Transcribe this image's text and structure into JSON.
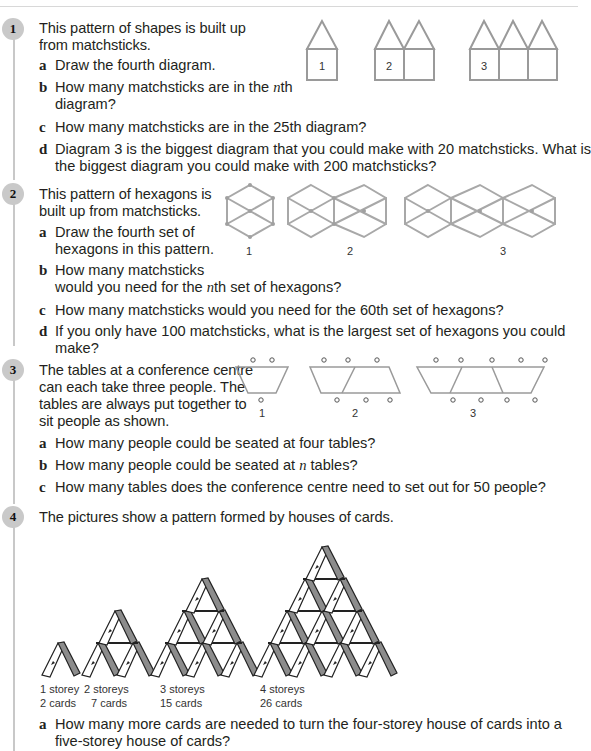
{
  "questions": [
    {
      "number": "1",
      "intro": [
        "This pattern of shapes is built up",
        "from matchsticks."
      ],
      "parts": [
        {
          "label": "a",
          "lines": [
            "Draw the fourth diagram."
          ]
        },
        {
          "label": "b",
          "lines_pre": "How many matchsticks are in the ",
          "var": "n",
          "lines_post": "th",
          "line2": "diagram?"
        },
        {
          "label": "c",
          "lines": [
            "How many matchsticks are in the 25th diagram?"
          ]
        },
        {
          "label": "d",
          "lines": [
            "Diagram 3 is the biggest diagram that you could make with 20 matchsticks. What is",
            "the biggest diagram you could make with 200 matchsticks?"
          ]
        }
      ],
      "figure_labels": [
        "1",
        "2",
        "3"
      ]
    },
    {
      "number": "2",
      "intro": [
        "This pattern of hexagons is",
        "built up from matchsticks."
      ],
      "parts": [
        {
          "label": "a",
          "lines": [
            "Draw the fourth set of",
            "hexagons in this pattern."
          ]
        },
        {
          "label": "b",
          "line1": "How many matchsticks",
          "pre": "would you need for the ",
          "var": "n",
          "post": "th set of hexagons?"
        },
        {
          "label": "c",
          "lines": [
            "How many matchsticks would you need for the 60th set of hexagons?"
          ]
        },
        {
          "label": "d",
          "lines": [
            "If you only have 100 matchsticks, what is the largest set of hexagons you could",
            "make?"
          ]
        }
      ],
      "figure_labels": [
        "1",
        "2",
        "3"
      ]
    },
    {
      "number": "3",
      "intro": [
        "The tables at a conference centre",
        "can each take three people. The",
        "tables are always put together to",
        "sit people as shown."
      ],
      "parts": [
        {
          "label": "a",
          "lines": [
            "How many people could be seated at four tables?"
          ]
        },
        {
          "label": "b",
          "pre": "How many people could be seated at ",
          "var": "n",
          "post": " tables?"
        },
        {
          "label": "c",
          "lines": [
            "How many tables does the conference centre need to set out for 50 people?"
          ]
        }
      ],
      "figure_labels": [
        "1",
        "2",
        "3"
      ]
    },
    {
      "number": "4",
      "intro": [
        "The pictures show a pattern formed by houses of cards."
      ],
      "captions": [
        {
          "storeys": "1 storey",
          "cards": "2 cards"
        },
        {
          "storeys": "2 storeys",
          "cards": "7 cards"
        },
        {
          "storeys": "3 storeys",
          "cards": "15 cards"
        },
        {
          "storeys": "4 storeys",
          "cards": "26 cards"
        }
      ],
      "parts": [
        {
          "label": "a",
          "lines": [
            "How many more cards are needed to turn the four-storey house of cards into a",
            "five-storey house of cards?"
          ]
        }
      ]
    }
  ],
  "colors": {
    "text": "#231f20",
    "number_circle": "#c9c9c9",
    "matchstick": "#9a9a9a",
    "card_grey": "#8c8c8c"
  }
}
